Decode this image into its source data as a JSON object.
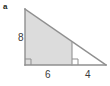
{
  "figure": {
    "part_label": "a",
    "shape": "right-triangle",
    "fill_color": "#dcdcdc",
    "stroke_color": "#9a9a9a",
    "label_color": "#3a3a3a",
    "background": "#ffffff",
    "vertices": {
      "apex": [
        25,
        9
      ],
      "bottom_left": [
        25,
        65
      ],
      "bottom_right": [
        106,
        65
      ],
      "interior_foot": [
        72,
        65
      ],
      "interior_top": [
        72,
        42
      ]
    },
    "shaded_region": "25,9 72,42 72,65 25,65",
    "interior_segment": {
      "x": 72,
      "y_top": 42,
      "y_bottom": 65
    },
    "right_angle_markers": [
      {
        "x": 25,
        "y": 65,
        "size": 6
      },
      {
        "x": 72,
        "y": 65,
        "size": 6
      }
    ],
    "measurements": [
      {
        "name": "vertical-leg",
        "value": "8",
        "position": "left"
      },
      {
        "name": "base-left-segment",
        "value": "6",
        "position": "bottom"
      },
      {
        "name": "base-right-segment",
        "value": "4",
        "position": "bottom"
      }
    ],
    "labels": {
      "vertical": "8",
      "base_left": "6",
      "base_right": "4"
    }
  }
}
